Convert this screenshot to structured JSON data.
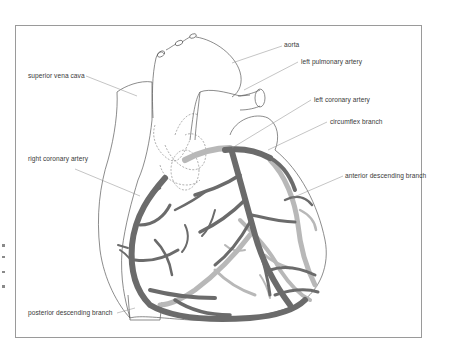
{
  "figure": {
    "type": "anatomical-illustration",
    "colors": {
      "frame": "#9a9a9a",
      "outline": "#5a5a5a",
      "anterior_vessels": "#6b6b6b",
      "posterior_vessels": "#b8b8b8",
      "leader_lines": "#8a8a8a",
      "label_text": "#3a3a3a"
    }
  },
  "labels": {
    "superior_vena_cava": "superior vena cava",
    "aorta": "aorta",
    "left_pulmonary_artery": "left pulmonary artery",
    "left_coronary_artery": "left coronary artery",
    "circumflex_branch": "circumflex branch",
    "right_coronary_artery": "right coronary artery",
    "anterior_descending_branch": "anterior descending branch",
    "posterior_descending_branch": "posterior descending branch"
  }
}
